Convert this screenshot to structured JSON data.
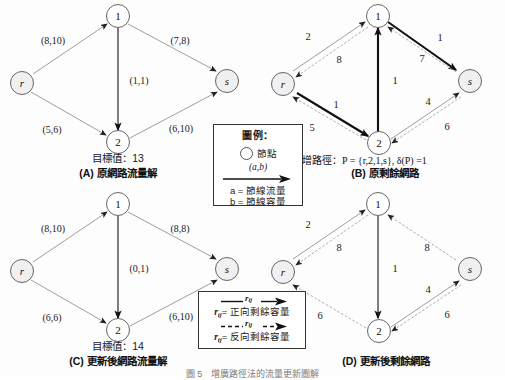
{
  "figure": {
    "panels": [
      {
        "id": "A",
        "caption": "(A) 原網路流量解",
        "objective_label": "目標值：13",
        "nodes": [
          {
            "id": "r",
            "label": "r",
            "italic": true
          },
          {
            "id": "1",
            "label": "1",
            "italic": false
          },
          {
            "id": "2",
            "label": "2",
            "italic": false
          },
          {
            "id": "s",
            "label": "s",
            "italic": true
          }
        ],
        "edges": [
          {
            "from": "r",
            "to": "1",
            "label": "(8,10)",
            "flow": 8,
            "capacity": 10
          },
          {
            "from": "1",
            "to": "s",
            "label": "(7,8)",
            "flow": 7,
            "capacity": 8
          },
          {
            "from": "1",
            "to": "2",
            "label": "(1,1)",
            "flow": 1,
            "capacity": 1
          },
          {
            "from": "r",
            "to": "2",
            "label": "(5,6)",
            "flow": 5,
            "capacity": 6
          },
          {
            "from": "2",
            "to": "s",
            "label": "(6,10)",
            "flow": 6,
            "capacity": 10
          }
        ]
      },
      {
        "id": "B",
        "caption": "(B) 原剩餘網路",
        "path_text": "擴增路徑：P = {r,2,1,s}, δ(P) =1",
        "nodes": [
          {
            "id": "r",
            "label": "r",
            "italic": true
          },
          {
            "id": "1",
            "label": "1",
            "italic": false
          },
          {
            "id": "2",
            "label": "2",
            "italic": false
          },
          {
            "id": "s",
            "label": "s",
            "italic": true
          }
        ],
        "edges": [
          {
            "from": "r",
            "to": "1",
            "label": "2",
            "kind": "forward"
          },
          {
            "from": "1",
            "to": "r",
            "label": "8",
            "kind": "backward"
          },
          {
            "from": "1",
            "to": "s",
            "label": "1",
            "kind": "forward"
          },
          {
            "from": "s",
            "to": "1",
            "label": "7",
            "kind": "backward"
          },
          {
            "from": "2",
            "to": "1",
            "label": "1",
            "kind": "backward"
          },
          {
            "from": "2",
            "to": "r",
            "label": "1",
            "kind": "forward"
          },
          {
            "from": "r",
            "to": "2",
            "label": "5",
            "kind": "backward"
          },
          {
            "from": "2",
            "to": "s",
            "label": "4",
            "kind": "forward"
          },
          {
            "from": "s",
            "to": "2",
            "label": "6",
            "kind": "backward"
          }
        ]
      },
      {
        "id": "C",
        "caption": "(C) 更新後網路流量解",
        "objective_label": "目標值：14",
        "nodes": [
          {
            "id": "r",
            "label": "r",
            "italic": true
          },
          {
            "id": "1",
            "label": "1",
            "italic": false
          },
          {
            "id": "2",
            "label": "2",
            "italic": false
          },
          {
            "id": "s",
            "label": "s",
            "italic": true
          }
        ],
        "edges": [
          {
            "from": "r",
            "to": "1",
            "label": "(8,10)",
            "flow": 8,
            "capacity": 10
          },
          {
            "from": "1",
            "to": "s",
            "label": "(8,8)",
            "flow": 8,
            "capacity": 8
          },
          {
            "from": "1",
            "to": "2",
            "label": "(0,1)",
            "flow": 0,
            "capacity": 1
          },
          {
            "from": "r",
            "to": "2",
            "label": "(6,6)",
            "flow": 6,
            "capacity": 6
          },
          {
            "from": "2",
            "to": "s",
            "label": "(6,10)",
            "flow": 6,
            "capacity": 10
          }
        ]
      },
      {
        "id": "D",
        "caption": "(D) 更新後剩餘網路",
        "nodes": [
          {
            "id": "r",
            "label": "r",
            "italic": true
          },
          {
            "id": "1",
            "label": "1",
            "italic": false
          },
          {
            "id": "2",
            "label": "2",
            "italic": false
          },
          {
            "id": "s",
            "label": "s",
            "italic": true
          }
        ],
        "edges": [
          {
            "from": "r",
            "to": "1",
            "label": "2",
            "kind": "forward"
          },
          {
            "from": "1",
            "to": "r",
            "label": "8",
            "kind": "backward"
          },
          {
            "from": "1",
            "to": "s",
            "label": "8",
            "kind": "backward"
          },
          {
            "from": "1",
            "to": "2",
            "label": "1",
            "kind": "forward"
          },
          {
            "from": "2",
            "to": "r",
            "label": "6",
            "kind": "backward"
          },
          {
            "from": "2",
            "to": "s",
            "label": "4",
            "kind": "forward"
          },
          {
            "from": "s",
            "to": "2",
            "label": "6",
            "kind": "backward"
          }
        ]
      }
    ],
    "legend_flow": {
      "title": "圖例：",
      "node_label": "節點",
      "edge_label": "(a,b)",
      "line_a": "a = 節線流量",
      "line_b": "b = 節線容量"
    },
    "legend_residual": {
      "forward_symbol": "r",
      "forward_sub": "ij",
      "forward_label": "= 正向剩餘容量",
      "backward_symbol": "r",
      "backward_sub": "ij",
      "backward_label": "= 反向剩餘容量"
    },
    "bottom_caption": "圖 5　增廣路徑法的流量更新圖解"
  }
}
